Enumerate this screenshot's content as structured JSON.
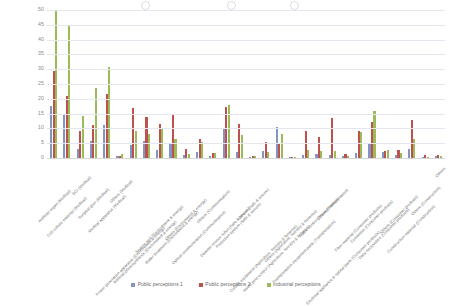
{
  "chart_data": {
    "type": "bar",
    "title": "",
    "xlabel": "",
    "ylabel": "",
    "ylim": [
      0,
      50
    ],
    "yticks": [
      0,
      5,
      10,
      15,
      20,
      25,
      30,
      35,
      40,
      45,
      50
    ],
    "grid": true,
    "legend_position": "bottom",
    "categories": [
      "Artificial organ (Medical)",
      "Cell culture material (Medical)",
      "BCI (Medical)",
      "Surgical glue (Medical)",
      "Medical apparatus (Medical)",
      "Others (Medical)",
      "Power generation apparatus (Environment & energy)",
      "Artificial photosynthesis (Environment & energy)",
      "Sewers grid (Environment & energy)",
      "Water treatment (Environment & energy)",
      "Others (Environment & energy)",
      "Optical communication (Communication)",
      "Others (Communication)",
      "Disaster rescue robot (Safe & secure)",
      "Protection system (Safe & secure)",
      "Others (Safe & secure)",
      "Culture equipment (Agriculture, forestry & fisheries)",
      "Insect pest control (Agriculture, forestry & fisheries)",
      "Others (Agriculture, forestry & fisheries)",
      "Transportation equipment parts (Transportation)",
      "Traffic control (Transportation)",
      "Others (Transportation)",
      "Electrical appliance & optical parts (Consumer products)",
      "Fiber material (Consumer products)",
      "Cosmetics (Consumer products)",
      "Daily necessities (Consumer products)",
      "Others (Consumer products)",
      "Construction material (Construction)",
      "Others (Construction)",
      "Others"
    ],
    "series": [
      {
        "name": "Public perceptions 1",
        "color": "#8295c4",
        "values": [
          17.5,
          15.0,
          3.0,
          5.8,
          11.0,
          0.6,
          4.3,
          5.8,
          2.8,
          5.0,
          1.0,
          2.2,
          0.8,
          10.0,
          2.2,
          0.4,
          2.4,
          10.5,
          0.5,
          1.0,
          1.5,
          1.0,
          0.6,
          1.6,
          4.7,
          2.0,
          1.0,
          3.2,
          0.4,
          0.6
        ]
      },
      {
        "name": "Public perceptions 2",
        "color": "#c0504d",
        "values": [
          29.5,
          21.0,
          9.0,
          11.0,
          21.5,
          0.8,
          17.0,
          14.0,
          11.5,
          14.5,
          3.0,
          6.3,
          1.6,
          17.3,
          11.5,
          0.7,
          5.3,
          5.0,
          0.5,
          9.0,
          7.0,
          13.5,
          1.2,
          9.0,
          12.2,
          2.5,
          2.8,
          12.8,
          1.0,
          1.0
        ]
      },
      {
        "name": "Industrial perceptions",
        "color": "#9bbb59",
        "values": [
          50.0,
          45.0,
          14.2,
          23.7,
          30.7,
          1.2,
          9.2,
          8.0,
          10.3,
          6.3,
          1.2,
          5.3,
          1.8,
          17.8,
          7.8,
          0.7,
          2.0,
          8.0,
          0.5,
          2.7,
          2.5,
          2.5,
          0.7,
          8.7,
          16.0,
          2.7,
          1.6,
          6.5,
          0.5,
          0.7
        ]
      }
    ]
  },
  "legend": {
    "items": [
      {
        "label": "Public perceptions 1",
        "color": "#8295c4"
      },
      {
        "label": "Public perceptions 2",
        "color": "#c0504d"
      },
      {
        "label": "Industrial perceptions",
        "color": "#9bbb59"
      }
    ]
  }
}
